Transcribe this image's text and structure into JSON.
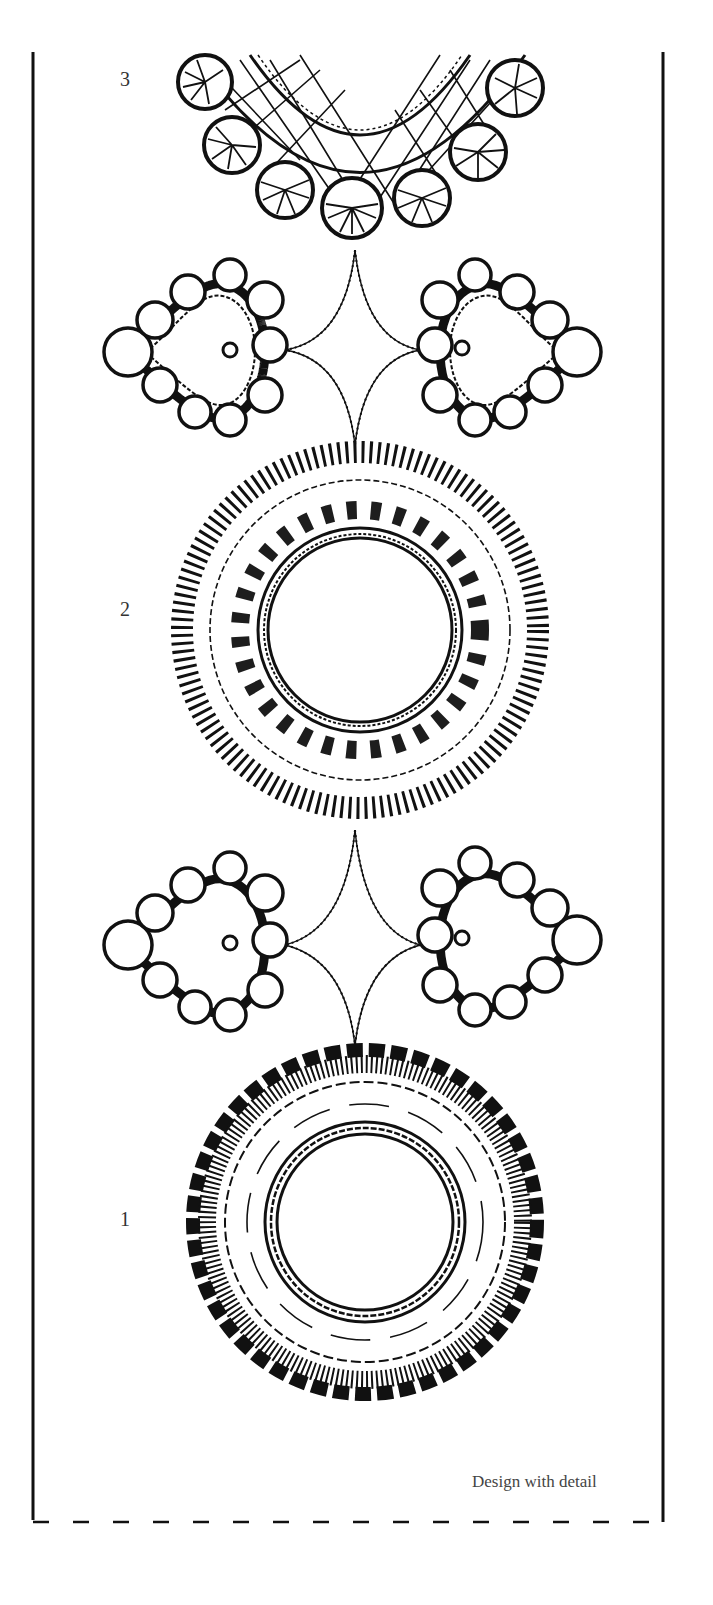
{
  "page": {
    "caption": "Design with detail",
    "labels": [
      {
        "id": "3",
        "text": "3"
      },
      {
        "id": "2",
        "text": "2"
      },
      {
        "id": "1",
        "text": "1"
      }
    ]
  },
  "motifs": [
    {
      "name": "scalloped-collar-3",
      "label": "3",
      "type": "half-collar with shell scallops and lattice fill"
    },
    {
      "name": "heart-pair-top",
      "type": "two hearts with wheel scallops joined by four-point star"
    },
    {
      "name": "rayed-ring-2",
      "label": "2",
      "type": "circular ring with radiating bars and feather stitch"
    },
    {
      "name": "heart-pair-bottom",
      "type": "two hearts with wheel scallops joined by four-point star"
    },
    {
      "name": "scalloped-ring-1",
      "label": "1",
      "type": "circular ring with scalloped edge and zigzag fill"
    }
  ],
  "colors": {
    "ink": "#111111",
    "paper": "#ffffff",
    "caption": "#444444"
  }
}
